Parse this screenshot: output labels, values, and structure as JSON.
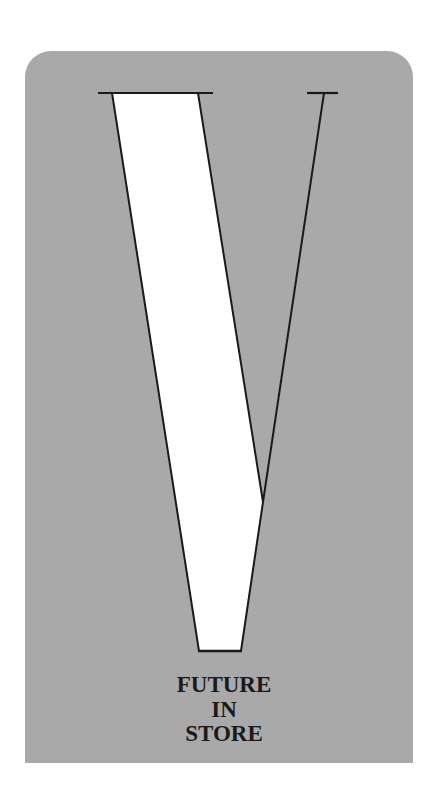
{
  "poster": {
    "background_color": "#a9a9a9",
    "letter": "V",
    "letter_fill": "#ffffff",
    "stroke_color": "#1a1a1a",
    "caption_lines": [
      "FUTURE",
      "IN",
      "STORE"
    ]
  }
}
